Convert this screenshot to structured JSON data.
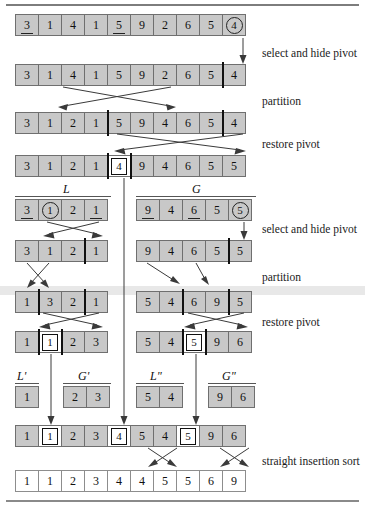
{
  "captions": {
    "select_hide_1": "select and hide pivot",
    "partition_1": "partition",
    "restore_1": "restore pivot",
    "select_hide_2": "select and hide pivot",
    "partition_2": "partition",
    "restore_2": "restore pivot",
    "insertion": "straight insertion sort"
  },
  "group_labels": {
    "L": "L",
    "G": "G",
    "Lp": "L'",
    "Gp": "G'",
    "Lpp": "L\"",
    "Gpp": "G\""
  },
  "rows": {
    "r1": {
      "name": "initial-array",
      "values": [
        "3",
        "1",
        "4",
        "1",
        "5",
        "9",
        "2",
        "6",
        "5",
        "4"
      ],
      "underlined": [
        0,
        4
      ],
      "circled": [
        9
      ]
    },
    "r2": {
      "name": "pivot-hidden-array",
      "values": [
        "3",
        "1",
        "4",
        "1",
        "5",
        "9",
        "2",
        "6",
        "5",
        "4"
      ],
      "bar_before": [
        9
      ]
    },
    "r3": {
      "name": "partitioned-array",
      "values": [
        "3",
        "1",
        "2",
        "1",
        "5",
        "9",
        "4",
        "6",
        "5",
        "4"
      ],
      "bar_before": [
        4,
        9
      ]
    },
    "r4": {
      "name": "pivot-restored-array",
      "values": [
        "3",
        "1",
        "2",
        "1",
        "4",
        "9",
        "4",
        "6",
        "5",
        "5"
      ],
      "boxed": [
        4
      ],
      "bar_before": [
        4,
        5
      ]
    },
    "r5L": {
      "name": "sub-array-L-select",
      "values": [
        "3",
        "1",
        "2",
        "1"
      ],
      "underlined": [
        0,
        3
      ],
      "circled": [
        1
      ]
    },
    "r5G": {
      "name": "sub-array-G-select",
      "values": [
        "9",
        "4",
        "6",
        "5",
        "5"
      ],
      "underlined": [
        0,
        2
      ],
      "circled": [
        4
      ]
    },
    "r6L": {
      "name": "sub-array-L-hidden",
      "values": [
        "3",
        "1",
        "2",
        "1"
      ],
      "bar_before": [
        3
      ]
    },
    "r6G": {
      "name": "sub-array-G-hidden",
      "values": [
        "9",
        "4",
        "6",
        "5",
        "5"
      ],
      "bar_before": [
        4
      ]
    },
    "r7L": {
      "name": "sub-array-L-partitioned",
      "values": [
        "1",
        "3",
        "2",
        "1"
      ],
      "bar_before": [
        1,
        3
      ]
    },
    "r7G": {
      "name": "sub-array-G-partitioned",
      "values": [
        "5",
        "4",
        "6",
        "9",
        "5"
      ],
      "bar_before": [
        2,
        4
      ]
    },
    "r8L": {
      "name": "sub-array-L-restored",
      "values": [
        "1",
        "1",
        "2",
        "3"
      ],
      "boxed": [
        1
      ],
      "bar_before": [
        1,
        2
      ]
    },
    "r8G": {
      "name": "sub-array-G-restored",
      "values": [
        "5",
        "4",
        "5",
        "9",
        "6"
      ],
      "boxed": [
        2
      ],
      "bar_before": [
        2,
        3
      ]
    },
    "r9Lp": {
      "name": "group-L-prime",
      "values": [
        "1"
      ]
    },
    "r9Gp": {
      "name": "group-G-prime",
      "values": [
        "2",
        "3"
      ]
    },
    "r9Lpp": {
      "name": "group-L-double-prime",
      "values": [
        "5",
        "4"
      ]
    },
    "r9Gpp": {
      "name": "group-G-double-prime",
      "values": [
        "9",
        "6"
      ]
    },
    "r10": {
      "name": "merged-array",
      "values": [
        "1",
        "1",
        "2",
        "3",
        "4",
        "5",
        "4",
        "5",
        "9",
        "6"
      ],
      "boxed": [
        1,
        4,
        7
      ]
    },
    "r11": {
      "name": "final-sorted-array",
      "values": [
        "1",
        "1",
        "2",
        "3",
        "4",
        "4",
        "5",
        "5",
        "6",
        "9"
      ],
      "plain": true
    }
  }
}
